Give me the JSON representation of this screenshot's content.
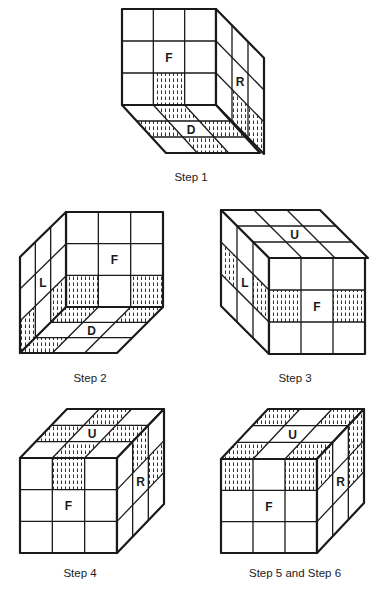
{
  "colors": {
    "line": "#1a1a1a",
    "background": "#ffffff",
    "hatch": "#333333"
  },
  "figures": [
    {
      "id": "step1",
      "caption": "Step 1",
      "caption_pos": [
        191,
        171
      ],
      "faces": [
        {
          "name": "front",
          "label": "F",
          "origin": [
            122,
            9
          ],
          "u": [
            94,
            0
          ],
          "v": [
            0,
            96
          ],
          "shaded": [
            [
              2,
              1
            ]
          ]
        },
        {
          "name": "right",
          "label": "R",
          "origin": [
            216,
            9
          ],
          "u": [
            48,
            49
          ],
          "v": [
            0,
            96
          ],
          "shaded": [
            [
              2,
              1
            ],
            [
              2,
              2
            ]
          ]
        },
        {
          "name": "down",
          "label": "D",
          "origin": [
            122,
            105
          ],
          "u": [
            94,
            0
          ],
          "v": [
            44,
            48
          ],
          "shaded": [
            [
              0,
              1
            ],
            [
              1,
              0
            ],
            [
              1,
              2
            ],
            [
              2,
              1
            ]
          ]
        }
      ]
    },
    {
      "id": "step2",
      "caption": "Step 2",
      "caption_pos": [
        90,
        372
      ],
      "faces": [
        {
          "name": "front",
          "label": "F",
          "origin": [
            66,
            212
          ],
          "u": [
            97,
            0
          ],
          "v": [
            0,
            95
          ],
          "shaded": [
            [
              2,
              0
            ],
            [
              2,
              2
            ]
          ]
        },
        {
          "name": "left",
          "label": "L",
          "origin": [
            20,
            257
          ],
          "u": [
            46,
            -45
          ],
          "v": [
            0,
            96
          ],
          "shaded": [
            [
              2,
              0
            ],
            [
              2,
              2
            ]
          ]
        },
        {
          "name": "down",
          "label": "D",
          "origin": [
            66,
            307
          ],
          "u": [
            97,
            0
          ],
          "v": [
            -46,
            46
          ],
          "shaded": [
            [
              0,
              0
            ],
            [
              0,
              2
            ],
            [
              2,
              0
            ]
          ]
        }
      ]
    },
    {
      "id": "step3",
      "caption": "Step 3",
      "caption_pos": [
        295,
        372
      ],
      "faces": [
        {
          "name": "up",
          "label": "U",
          "origin": [
            221,
            210
          ],
          "u": [
            99,
            0
          ],
          "v": [
            48,
            48
          ],
          "shaded": []
        },
        {
          "name": "left",
          "label": "L",
          "origin": [
            221,
            210
          ],
          "u": [
            48,
            48
          ],
          "v": [
            0,
            96
          ],
          "shaded": [
            [
              1,
              0
            ],
            [
              1,
              2
            ]
          ]
        },
        {
          "name": "front",
          "label": "F",
          "origin": [
            269,
            258
          ],
          "u": [
            96,
            0
          ],
          "v": [
            0,
            96
          ],
          "shaded": [
            [
              1,
              0
            ],
            [
              1,
              2
            ]
          ]
        }
      ]
    },
    {
      "id": "step4",
      "caption": "Step 4",
      "caption_pos": [
        80,
        567
      ],
      "faces": [
        {
          "name": "up",
          "label": "U",
          "origin": [
            20,
            458
          ],
          "u": [
            97,
            0
          ],
          "v": [
            47,
            -49
          ],
          "shaded": [
            [
              0,
              1
            ],
            [
              1,
              0
            ],
            [
              1,
              2
            ],
            [
              2,
              1
            ]
          ]
        },
        {
          "name": "front",
          "label": "F",
          "origin": [
            20,
            458
          ],
          "u": [
            97,
            0
          ],
          "v": [
            0,
            95
          ],
          "shaded": [
            [
              0,
              1
            ]
          ]
        },
        {
          "name": "right",
          "label": "R",
          "origin": [
            117,
            458
          ],
          "u": [
            47,
            -49
          ],
          "v": [
            0,
            95
          ],
          "shaded": [
            [
              0,
              1
            ],
            [
              1,
              2
            ]
          ]
        }
      ]
    },
    {
      "id": "step5-6",
      "caption": "Step 5 and Step 6",
      "caption_pos": [
        295,
        567
      ],
      "faces": [
        {
          "name": "up",
          "label": "U",
          "origin": [
            221,
            459
          ],
          "u": [
            96,
            0
          ],
          "v": [
            47,
            -50
          ],
          "shaded": [
            [
              0,
              0
            ],
            [
              0,
              2
            ],
            [
              2,
              0
            ],
            [
              2,
              2
            ]
          ]
        },
        {
          "name": "front",
          "label": "F",
          "origin": [
            221,
            459
          ],
          "u": [
            96,
            0
          ],
          "v": [
            0,
            94
          ],
          "shaded": [
            [
              0,
              0
            ],
            [
              0,
              2
            ]
          ]
        },
        {
          "name": "right",
          "label": "R",
          "origin": [
            317,
            459
          ],
          "u": [
            47,
            -50
          ],
          "v": [
            0,
            94
          ],
          "shaded": [
            [
              0,
              0
            ],
            [
              0,
              2
            ],
            [
              1,
              2
            ]
          ]
        }
      ]
    }
  ]
}
